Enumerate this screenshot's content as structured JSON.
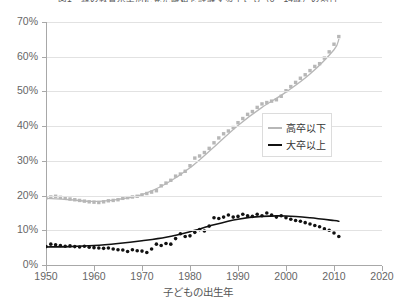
{
  "chart_data": {
    "type": "scatter",
    "title": "図1　親の教育水準別に見た離婚を経験する子ども（0〜14歳）の割合",
    "xlabel": "子どもの出生年",
    "ylabel": "",
    "xlim": [
      1950,
      2020
    ],
    "ylim": [
      0,
      70
    ],
    "xticks": [
      1950,
      1960,
      1970,
      1980,
      1990,
      2000,
      2010,
      2020
    ],
    "xtick_labels": [
      "1950",
      "1960",
      "1970",
      "1980",
      "1990",
      "2000",
      "2010",
      "2020"
    ],
    "yticks": [
      0,
      10,
      20,
      30,
      40,
      50,
      60,
      70
    ],
    "ytick_labels": [
      "0%",
      "10%",
      "20%",
      "30%",
      "40%",
      "50%",
      "60%",
      "70%"
    ],
    "grid": "horizontal",
    "legend_position": "center-right",
    "series": [
      {
        "name": "高卒以下",
        "color": "#b7b7b7",
        "marker": "square",
        "x": [
          1950,
          1951,
          1952,
          1953,
          1954,
          1955,
          1956,
          1957,
          1958,
          1959,
          1960,
          1961,
          1962,
          1963,
          1964,
          1965,
          1966,
          1967,
          1968,
          1969,
          1970,
          1971,
          1972,
          1973,
          1974,
          1975,
          1976,
          1977,
          1978,
          1979,
          1980,
          1981,
          1982,
          1983,
          1984,
          1985,
          1986,
          1987,
          1988,
          1989,
          1990,
          1991,
          1992,
          1993,
          1994,
          1995,
          1996,
          1997,
          1998,
          1999,
          2000,
          2001,
          2002,
          2003,
          2004,
          2005,
          2006,
          2007,
          2008,
          2009,
          2010,
          2011
        ],
        "values": [
          19.3,
          19.6,
          19.8,
          19.5,
          19.2,
          19.0,
          18.8,
          18.6,
          18.4,
          18.2,
          18.1,
          18.0,
          18.2,
          18.5,
          18.6,
          18.8,
          19.2,
          19.4,
          19.6,
          19.8,
          20.2,
          20.6,
          21.0,
          21.4,
          22.8,
          23.6,
          24.4,
          25.6,
          26.2,
          27.0,
          28.6,
          30.8,
          31.4,
          32.4,
          33.6,
          35.2,
          36.6,
          37.8,
          38.6,
          39.6,
          41.0,
          42.2,
          43.4,
          44.2,
          45.4,
          46.4,
          46.8,
          47.2,
          47.6,
          48.6,
          50.2,
          51.4,
          52.6,
          53.8,
          54.8,
          56.0,
          57.2,
          58.0,
          59.6,
          61.4,
          63.6,
          65.8
        ]
      },
      {
        "name": "大卒以上",
        "color": "#111111",
        "marker": "circle",
        "x": [
          1950,
          1951,
          1952,
          1953,
          1954,
          1955,
          1956,
          1957,
          1958,
          1959,
          1960,
          1961,
          1962,
          1963,
          1964,
          1965,
          1966,
          1967,
          1968,
          1969,
          1970,
          1971,
          1972,
          1973,
          1974,
          1975,
          1976,
          1977,
          1978,
          1979,
          1980,
          1981,
          1982,
          1983,
          1984,
          1985,
          1986,
          1987,
          1988,
          1989,
          1990,
          1991,
          1992,
          1993,
          1994,
          1995,
          1996,
          1997,
          1998,
          1999,
          2000,
          2001,
          2002,
          2003,
          2004,
          2005,
          2006,
          2007,
          2008,
          2009,
          2010,
          2011
        ],
        "values": [
          5.3,
          6.0,
          5.8,
          5.6,
          5.4,
          5.5,
          5.3,
          5.2,
          5.4,
          5.1,
          5.0,
          4.9,
          4.8,
          4.9,
          4.6,
          4.4,
          4.3,
          3.9,
          4.4,
          4.1,
          4.0,
          3.6,
          4.6,
          6.0,
          5.6,
          6.2,
          6.0,
          7.6,
          9.0,
          8.2,
          8.4,
          9.4,
          10.2,
          9.8,
          11.2,
          13.6,
          13.4,
          13.8,
          14.4,
          13.8,
          14.0,
          14.6,
          14.2,
          14.0,
          14.6,
          14.2,
          15.0,
          14.4,
          13.8,
          14.2,
          13.6,
          13.2,
          12.8,
          12.6,
          12.2,
          11.8,
          11.4,
          11.0,
          10.4,
          10.0,
          9.2,
          8.2
        ]
      }
    ],
    "trend_lines": [
      {
        "name": "高卒以下",
        "color": "#b7b7b7",
        "points": [
          [
            1950,
            19.2
          ],
          [
            1955,
            18.8
          ],
          [
            1960,
            18.3
          ],
          [
            1965,
            18.9
          ],
          [
            1970,
            20.3
          ],
          [
            1975,
            23.4
          ],
          [
            1980,
            28.0
          ],
          [
            1985,
            34.0
          ],
          [
            1990,
            40.2
          ],
          [
            1995,
            45.4
          ],
          [
            2000,
            49.8
          ],
          [
            2005,
            55.0
          ],
          [
            2010,
            62.0
          ],
          [
            2011,
            65.0
          ]
        ]
      },
      {
        "name": "大卒以上",
        "color": "#111111",
        "points": [
          [
            1950,
            5.2
          ],
          [
            1955,
            5.3
          ],
          [
            1960,
            5.6
          ],
          [
            1965,
            6.2
          ],
          [
            1970,
            7.0
          ],
          [
            1975,
            8.0
          ],
          [
            1980,
            9.6
          ],
          [
            1985,
            11.6
          ],
          [
            1990,
            13.2
          ],
          [
            1995,
            14.0
          ],
          [
            2000,
            14.1
          ],
          [
            2005,
            13.6
          ],
          [
            2010,
            12.8
          ],
          [
            2011,
            12.6
          ]
        ]
      }
    ]
  },
  "legend": {
    "items": [
      {
        "label": "高卒以下",
        "color": "#b7b7b7"
      },
      {
        "label": "大卒以上",
        "color": "#111111"
      }
    ]
  }
}
